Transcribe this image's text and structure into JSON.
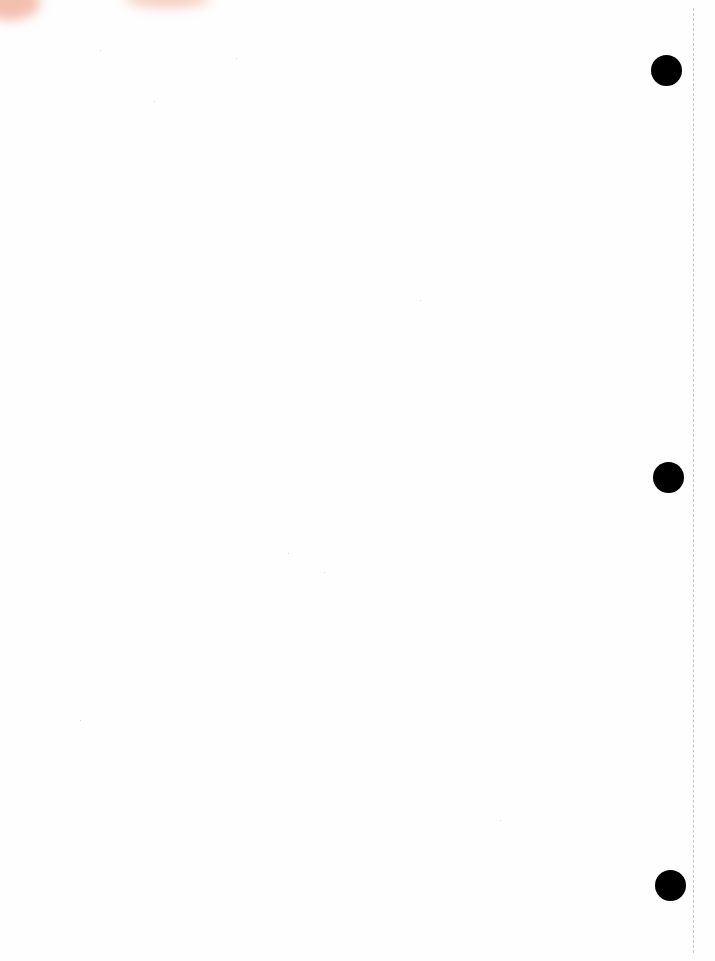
{
  "page": {
    "type": "blank-punched-sheet",
    "background_color": "#fefefe",
    "hole_color": "#000000",
    "perforation_color": "#c8c8c8",
    "holes": [
      {
        "x": 651,
        "y": 55
      },
      {
        "x": 653,
        "y": 462
      },
      {
        "x": 655,
        "y": 870
      }
    ]
  }
}
